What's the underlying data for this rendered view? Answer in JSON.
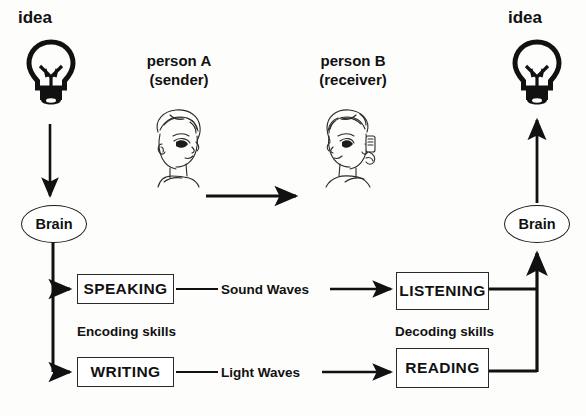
{
  "diagram": {
    "ink_color": "#111111",
    "box_border_color": "#2a2a2a",
    "background": "#fdfdfc"
  },
  "left_side": {
    "idea_label": "idea",
    "bulb_icon": "lightbulb-icon",
    "brain_label": "Brain",
    "skills_label": "Encoding skills",
    "boxes": [
      {
        "label": "SPEAKING"
      },
      {
        "label": "WRITING"
      }
    ]
  },
  "right_side": {
    "idea_label": "idea",
    "bulb_icon": "lightbulb-icon",
    "brain_label": "Brain",
    "skills_label": "Decoding skills",
    "boxes": [
      {
        "label": "LISTENING"
      },
      {
        "label": "READING"
      }
    ]
  },
  "people": [
    {
      "name": "person A",
      "role": "(sender)",
      "icon": "person-a-face-icon"
    },
    {
      "name": "person B",
      "role": "(receiver)",
      "icon": "person-b-face-icon"
    }
  ],
  "channels": [
    {
      "label": "Sound Waves"
    },
    {
      "label": "Light Waves"
    }
  ],
  "arrows": {
    "idea_to_brain": "down-arrow",
    "sender_to_receiver": "right-arrow",
    "brain_to_skills": "branch-arrow",
    "skills_to_idea": "up-arrow"
  }
}
